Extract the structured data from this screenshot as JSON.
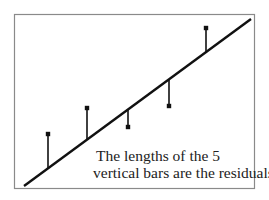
{
  "chart_data": {
    "type": "scatter",
    "title": "",
    "xlabel": "",
    "ylabel": "",
    "grid": false,
    "legend": null,
    "regression_line": {
      "x1": 24,
      "y1": 186,
      "x2": 251,
      "y2": 19
    },
    "points": [
      {
        "x": 48,
        "y": 134,
        "line_y": 168
      },
      {
        "x": 87,
        "y": 108,
        "line_y": 139
      },
      {
        "x": 128,
        "y": 127,
        "line_y": 110
      },
      {
        "x": 169,
        "y": 106,
        "line_y": 79
      },
      {
        "x": 206,
        "y": 28,
        "line_y": 52
      }
    ],
    "residual_signs": [
      "positive",
      "positive",
      "negative",
      "negative",
      "positive"
    ],
    "annotation": [
      "The lengths of the 5",
      "vertical bars are the residuals."
    ]
  },
  "caption": {
    "line1": "The lengths of the 5",
    "line2": "vertical bars are the residuals."
  },
  "colors": {
    "frame": "#8a8a8a",
    "ink": "#111111",
    "background": "#ffffff"
  }
}
